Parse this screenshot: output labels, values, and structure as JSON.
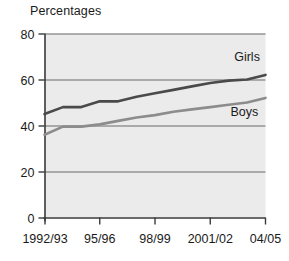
{
  "chart_data": {
    "type": "line",
    "title": "Percentages",
    "xlabel": "",
    "ylabel": "",
    "ylim": [
      0,
      80
    ],
    "yticks": [
      0,
      20,
      40,
      60,
      80
    ],
    "ytick_labels": [
      "0",
      "20",
      "40",
      "60",
      "80"
    ],
    "grid": true,
    "grid_axis": "y",
    "legend": "inline-labels",
    "categories": [
      "1992/93",
      "93/94",
      "94/95",
      "95/96",
      "96/97",
      "97/98",
      "98/99",
      "99/00",
      "2000/01",
      "2001/02",
      "02/03",
      "03/04",
      "04/05"
    ],
    "xtick_labels": [
      "1992/93",
      "95/96",
      "98/99",
      "2001/02",
      "04/05"
    ],
    "xtick_label_indices": [
      0,
      3,
      6,
      9,
      12
    ],
    "series": [
      {
        "name": "Girls",
        "color": "#4a4a4a",
        "values": [
          45,
          48,
          48,
          50.5,
          50.5,
          52.5,
          54,
          55.5,
          57,
          58.5,
          59.5,
          60,
          62
        ],
        "label_x_index": 10.3,
        "label_y": 68
      },
      {
        "name": "Boys",
        "color": "#8c8c8c",
        "values": [
          36,
          39.5,
          39.5,
          40.5,
          42,
          43.5,
          44.5,
          46,
          47,
          48,
          49,
          50,
          52
        ],
        "label_x_index": 10.1,
        "label_y": 44
      }
    ],
    "colors": {
      "plot_background": "#ebebeb",
      "axis": "#3a3a3a",
      "gridline": "#6b6b6b",
      "girls_line": "#4a4a4a",
      "boys_line": "#8c8c8c",
      "text": "#1a1a1a"
    }
  }
}
